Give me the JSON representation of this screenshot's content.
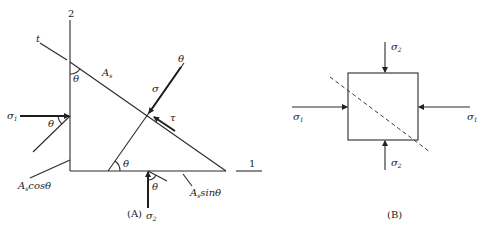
{
  "figure_a": {
    "caption": "(A)",
    "axis_2_label": "2",
    "axis_1_label": "1",
    "plane_label": "t",
    "area_label": "A",
    "area_sub": "s",
    "area_cos_label": "cosθ",
    "area_sin_label": "sinθ",
    "sigma_label": "σ",
    "tau_label": "τ",
    "theta_label": "θ",
    "sigma1_label": "σ",
    "sigma1_sub": "1",
    "sigma2_label": "σ",
    "sigma2_sub": "2"
  },
  "figure_b": {
    "caption": "(B)",
    "sigma1_left_label": "σ",
    "sigma1_right_label": "σ",
    "sigma1_sub": "1",
    "sigma2_top_label": "σ",
    "sigma2_bottom_label": "σ",
    "sigma2_sub": "2"
  }
}
